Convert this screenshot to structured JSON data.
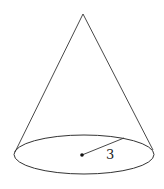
{
  "diagram": {
    "type": "cone",
    "radius_label": "3",
    "stroke_color": "#333333",
    "background": "#ffffff",
    "apex": [
      83,
      14
    ],
    "base": {
      "cx": 84,
      "cy": 154.5,
      "rx": 70,
      "ry": 19.5
    },
    "left_tangent": [
      15,
      152
    ],
    "right_tangent": [
      153,
      150
    ],
    "center_dot": [
      82,
      155
    ],
    "radius_end": [
      124,
      138
    ],
    "label_pos": [
      106,
      159
    ]
  }
}
